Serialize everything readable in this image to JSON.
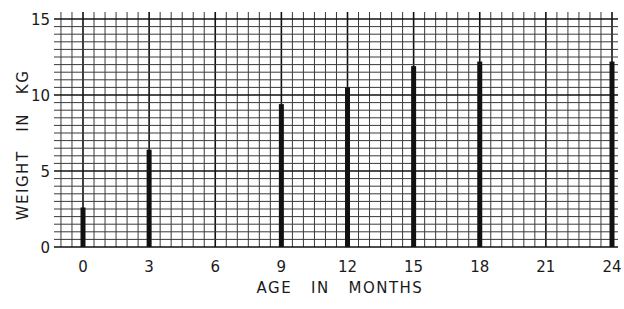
{
  "chart_data": {
    "type": "bar",
    "title": "",
    "xlabel": "AGE   IN   MONTHS",
    "ylabel": "WEIGHT   IN   KG",
    "categories": [
      "0",
      "3",
      "6",
      "9",
      "12",
      "15",
      "18",
      "21",
      "24"
    ],
    "x_ticks": [
      0,
      3,
      6,
      9,
      12,
      15,
      18,
      21,
      24
    ],
    "y_ticks": [
      0,
      5,
      10,
      15
    ],
    "xlim": [
      -1,
      24.3
    ],
    "ylim": [
      0,
      15.5
    ],
    "grid": true,
    "legend": null,
    "series": [
      {
        "name": "Weight (kg)",
        "x": [
          0,
          3,
          9,
          12,
          15,
          18,
          24
        ],
        "values": [
          2.6,
          6.4,
          9.4,
          10.5,
          11.9,
          12.2,
          12.2
        ]
      }
    ],
    "colors": {
      "bar": "#111111",
      "grid_minor": "#3a3a3a",
      "grid_major": "#111111",
      "background": "#ffffff"
    }
  }
}
